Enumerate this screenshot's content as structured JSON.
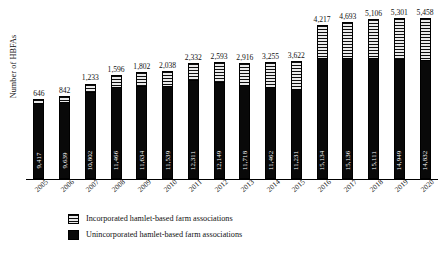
{
  "chart_data": {
    "type": "bar",
    "subtype": "stacked-bar",
    "title": "",
    "xlabel": "",
    "ylabel": "Number of HBFAs",
    "categories": [
      "2005",
      "2006",
      "2007",
      "2008",
      "2009",
      "2010",
      "2011",
      "2012",
      "2013",
      "2014",
      "2015",
      "2016",
      "2017",
      "2018",
      "2019",
      "2020"
    ],
    "series": [
      {
        "name": "Unincorporated hamlet-based farm associations",
        "color": "#0a0a0a",
        "values": [
          9417,
          9639,
          10802,
          11466,
          11634,
          11539,
          12311,
          12149,
          11718,
          11462,
          11231,
          15134,
          15136,
          15111,
          14949,
          14832
        ],
        "labels": [
          "9,417",
          "9,639",
          "10,802",
          "11,466",
          "11,634",
          "11,539",
          "12,311",
          "12,149",
          "11,718",
          "11,462",
          "11,231",
          "15,134",
          "15,136",
          "15,111",
          "14,949",
          "14,832"
        ],
        "label_position": "inside",
        "label_color": "#ffffff",
        "label_rotation": -90
      },
      {
        "name": "Incorporated hamlet-based farm associations",
        "color": "#c9c9c9",
        "pattern": "horizontal-stripes",
        "values": [
          646,
          842,
          1233,
          1596,
          1802,
          2038,
          2332,
          2593,
          2916,
          3255,
          3622,
          4217,
          4693,
          5106,
          5301,
          5458
        ],
        "labels": [
          "646",
          "842",
          "1,233",
          "1,596",
          "1,802",
          "2,038",
          "2,332",
          "2,593",
          "2,916",
          "3,255",
          "3,622",
          "4,217",
          "4,693",
          "5,106",
          "5,301",
          "5,458"
        ],
        "label_position": "above",
        "label_color": "#111111"
      }
    ],
    "totals": [
      10063,
      10481,
      12035,
      13062,
      13436,
      13577,
      14643,
      14742,
      14634,
      14717,
      14853,
      19351,
      19829,
      20217,
      20250,
      20290
    ],
    "ylim": [
      0,
      20290
    ],
    "grid": false,
    "axis": {
      "x_visible": true,
      "y_visible": false,
      "x_tick_rotation": -45
    },
    "legend": {
      "position": "bottom-left",
      "entries": [
        "Incorporated hamlet-based farm associations",
        "Unincorporated hamlet-based farm associations"
      ]
    }
  }
}
